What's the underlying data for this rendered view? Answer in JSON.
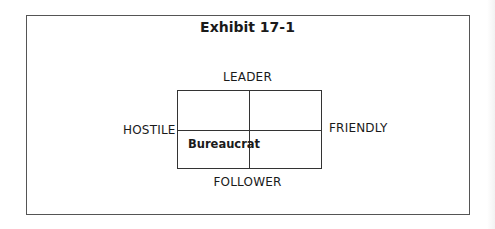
{
  "exhibit": {
    "title": "Exhibit 17-1"
  },
  "axes": {
    "top": "LEADER",
    "bottom": "FOLLOWER",
    "left": "HOSTILE",
    "right": "FRIENDLY"
  },
  "quadrants": {
    "top_left": "",
    "top_right": "",
    "bottom_left": "Bureaucrat",
    "bottom_right": ""
  }
}
